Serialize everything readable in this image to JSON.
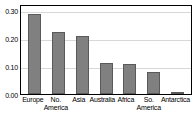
{
  "chart_data": {
    "type": "bar",
    "title": "",
    "subtitle": "",
    "xlabel": "",
    "ylabel": "",
    "categories": [
      "Europe",
      "No. America",
      "Asia",
      "Australia",
      "Africa",
      "So. America",
      "Antarctica"
    ],
    "category_lines": [
      [
        "Europe",
        ""
      ],
      [
        "No.",
        "America"
      ],
      [
        "Asia",
        ""
      ],
      [
        "Australia",
        ""
      ],
      [
        "Africa",
        ""
      ],
      [
        "So.",
        "America"
      ],
      [
        "Antarctica",
        ""
      ]
    ],
    "values": [
      0.285,
      0.222,
      0.207,
      0.112,
      0.105,
      0.078,
      0.007
    ],
    "series": [
      {
        "name": "",
        "values": [
          0.285,
          0.222,
          0.207,
          0.112,
          0.105,
          0.078,
          0.007
        ]
      }
    ],
    "ylim": [
      0.0,
      0.32
    ],
    "ytick_values": [
      0.0,
      0.1,
      0.2,
      0.3
    ],
    "ytick_labels": [
      "0.00",
      "0.10",
      "0.20",
      "0.30"
    ],
    "gridlines_at": [
      0.1,
      0.2,
      0.3
    ],
    "grid": true,
    "legend": null,
    "legend_position": "none",
    "bar_color": "#808080",
    "bar_border_color": "#5a5a5a",
    "grid_color": "#d8d8d8",
    "axis_color": "#000000",
    "background_color": "#ffffff"
  }
}
